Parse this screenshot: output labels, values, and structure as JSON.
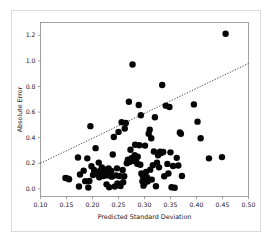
{
  "chart_data": {
    "type": "scatter",
    "title": "",
    "xlabel": "Predicted Standard Deviation",
    "ylabel": "Absolute Error",
    "xlim": [
      0.1,
      0.5
    ],
    "ylim": [
      -0.06,
      1.3
    ],
    "grid": false,
    "legend": null,
    "xticks": [
      0.1,
      0.15,
      0.2,
      0.25,
      0.3,
      0.35,
      0.4,
      0.45,
      0.5
    ],
    "xticklabels": [
      "0.10",
      "0.15",
      "0.20",
      "0.25",
      "0.30",
      "0.35",
      "0.40",
      "0.45",
      "0.50"
    ],
    "yticks": [
      0.0,
      0.2,
      0.4,
      0.6,
      0.8,
      1.0,
      1.2
    ],
    "yticklabels": [
      "0.0",
      "0.2",
      "0.4",
      "0.6",
      "0.8",
      "1.0",
      "1.2"
    ],
    "marker": "circle",
    "marker_color": "#060606",
    "marker_size": 3.2,
    "trendline": {
      "style": "dotted",
      "color": "#3a3a3a",
      "x0": 0.1,
      "y0": 0.2,
      "x1": 0.5,
      "y1": 0.98
    },
    "points": [
      [
        0.148,
        0.085
      ],
      [
        0.152,
        0.082
      ],
      [
        0.155,
        0.075
      ],
      [
        0.172,
        0.245
      ],
      [
        0.174,
        0.018
      ],
      [
        0.176,
        0.112
      ],
      [
        0.183,
        0.142
      ],
      [
        0.186,
        0.06
      ],
      [
        0.19,
        0.238
      ],
      [
        0.192,
        0.01
      ],
      [
        0.194,
        0.062
      ],
      [
        0.196,
        0.49
      ],
      [
        0.198,
        0.176
      ],
      [
        0.201,
        0.108
      ],
      [
        0.203,
        0.148
      ],
      [
        0.206,
        0.318
      ],
      [
        0.208,
        0.132
      ],
      [
        0.21,
        0.118
      ],
      [
        0.212,
        0.205
      ],
      [
        0.213,
        0.09
      ],
      [
        0.215,
        0.142
      ],
      [
        0.216,
        0.128
      ],
      [
        0.218,
        0.168
      ],
      [
        0.219,
        0.115
      ],
      [
        0.221,
        0.1
      ],
      [
        0.222,
        0.135
      ],
      [
        0.224,
        0.122
      ],
      [
        0.226,
        0.15
      ],
      [
        0.227,
        0.035
      ],
      [
        0.229,
        0.105
      ],
      [
        0.231,
        0.16
      ],
      [
        0.232,
        0.012
      ],
      [
        0.234,
        0.118
      ],
      [
        0.236,
        0.14
      ],
      [
        0.237,
        0.095
      ],
      [
        0.239,
        0.268
      ],
      [
        0.241,
        0.405
      ],
      [
        0.243,
        0.018
      ],
      [
        0.245,
        0.105
      ],
      [
        0.247,
        0.16
      ],
      [
        0.248,
        0.042
      ],
      [
        0.25,
        0.445
      ],
      [
        0.252,
        0.1
      ],
      [
        0.254,
        0.022
      ],
      [
        0.256,
        0.52
      ],
      [
        0.258,
        0.148
      ],
      [
        0.259,
        0.052
      ],
      [
        0.261,
        0.098
      ],
      [
        0.262,
        0.472
      ],
      [
        0.264,
        0.515
      ],
      [
        0.266,
        0.2
      ],
      [
        0.268,
        0.228
      ],
      [
        0.27,
        0.68
      ],
      [
        0.271,
        0.21
      ],
      [
        0.273,
        0.305
      ],
      [
        0.275,
        0.24
      ],
      [
        0.277,
        0.972
      ],
      [
        0.279,
        0.218
      ],
      [
        0.281,
        0.262
      ],
      [
        0.282,
        0.345
      ],
      [
        0.284,
        0.23
      ],
      [
        0.286,
        0.196
      ],
      [
        0.287,
        0.252
      ],
      [
        0.289,
        0.655
      ],
      [
        0.29,
        0.34
      ],
      [
        0.292,
        0.188
      ],
      [
        0.293,
        0.575
      ],
      [
        0.294,
        0.12
      ],
      [
        0.296,
        0.06
      ],
      [
        0.297,
        0.098
      ],
      [
        0.298,
        0.025
      ],
      [
        0.3,
        0.042
      ],
      [
        0.301,
        0.338
      ],
      [
        0.303,
        0.132
      ],
      [
        0.305,
        0.088
      ],
      [
        0.306,
        0.058
      ],
      [
        0.308,
        0.43
      ],
      [
        0.31,
        0.462
      ],
      [
        0.311,
        0.15
      ],
      [
        0.313,
        0.395
      ],
      [
        0.314,
        0.072
      ],
      [
        0.316,
        0.185
      ],
      [
        0.318,
        0.292
      ],
      [
        0.32,
        0.56
      ],
      [
        0.322,
        0.02
      ],
      [
        0.324,
        0.205
      ],
      [
        0.326,
        0.262
      ],
      [
        0.328,
        0.168
      ],
      [
        0.33,
        0.29
      ],
      [
        0.332,
        0.28
      ],
      [
        0.334,
        0.812
      ],
      [
        0.336,
        0.288
      ],
      [
        0.338,
        0.098
      ],
      [
        0.341,
        0.65
      ],
      [
        0.344,
        0.195
      ],
      [
        0.346,
        0.12
      ],
      [
        0.348,
        0.64
      ],
      [
        0.35,
        0.285
      ],
      [
        0.352,
        0.012
      ],
      [
        0.355,
        0.178
      ],
      [
        0.358,
        0.008
      ],
      [
        0.362,
        0.242
      ],
      [
        0.365,
        0.182
      ],
      [
        0.368,
        0.44
      ],
      [
        0.37,
        0.43
      ],
      [
        0.372,
        0.1
      ],
      [
        0.395,
        0.66
      ],
      [
        0.402,
        0.525
      ],
      [
        0.408,
        0.395
      ],
      [
        0.424,
        0.238
      ],
      [
        0.449,
        0.248
      ],
      [
        0.456,
        1.212
      ]
    ]
  }
}
